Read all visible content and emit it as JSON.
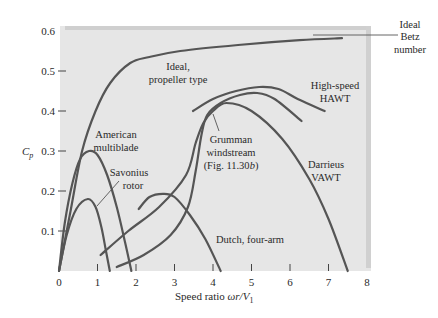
{
  "chart_data": {
    "type": "line",
    "title": "",
    "xlabel": "Speed ratio ωr/V₁",
    "ylabel": "Cp",
    "xlim": [
      0,
      8
    ],
    "ylim": [
      0,
      0.6
    ],
    "x_ticks": [
      0,
      1,
      2,
      3,
      4,
      5,
      6,
      7,
      8
    ],
    "y_ticks": [
      0.1,
      0.2,
      0.3,
      0.4,
      0.5,
      0.6
    ],
    "x_tick_labels": [
      "0",
      "1",
      "2",
      "3",
      "4",
      "5",
      "6",
      "7",
      "8"
    ],
    "y_tick_labels": [
      "0.1",
      "0.2",
      "0.3",
      "0.4",
      "0.5",
      "0.6"
    ],
    "grid": false,
    "legend": "none (inline annotations)",
    "series": [
      {
        "name": "Ideal, propeller type",
        "x": [
          0,
          0.3,
          0.6,
          0.95,
          1.33,
          1.85,
          2.35,
          3.15,
          4.65,
          6.25,
          7.35
        ],
        "y": [
          0,
          0.15,
          0.3,
          0.4,
          0.47,
          0.52,
          0.535,
          0.55,
          0.565,
          0.577,
          0.582
        ]
      },
      {
        "name": "Ideal Betz number",
        "x": [
          6.4,
          7.3
        ],
        "y": [
          0.593,
          0.593
        ]
      },
      {
        "name": "American multiblade",
        "x": [
          0,
          0.15,
          0.35,
          0.55,
          0.78,
          1.0,
          1.25,
          1.5,
          1.72,
          1.88
        ],
        "y": [
          0,
          0.12,
          0.22,
          0.28,
          0.3,
          0.29,
          0.24,
          0.16,
          0.07,
          0
        ]
      },
      {
        "name": "Savonius rotor",
        "x": [
          0,
          0.2,
          0.45,
          0.75,
          0.95,
          1.1,
          1.22,
          1.32
        ],
        "y": [
          0,
          0.09,
          0.155,
          0.18,
          0.16,
          0.11,
          0.05,
          0
        ]
      },
      {
        "name": "Dutch, four-arm",
        "x": [
          2.07,
          2.35,
          2.7,
          3.0,
          3.4,
          3.8,
          4.2
        ],
        "y": [
          0.155,
          0.185,
          0.193,
          0.185,
          0.14,
          0.08,
          0.0
        ]
      },
      {
        "name": "Grumman windstream (Fig. 11.30b)",
        "x": [
          1.5,
          2.2,
          2.9,
          3.35,
          3.55,
          3.7,
          3.85,
          4.2,
          4.7,
          5.15,
          5.6,
          6.3
        ],
        "y": [
          0.01,
          0.04,
          0.09,
          0.16,
          0.25,
          0.34,
          0.39,
          0.42,
          0.44,
          0.445,
          0.43,
          0.375
        ]
      },
      {
        "name": "Darrieus VAWT",
        "x": [
          1.08,
          1.8,
          2.6,
          3.3,
          3.55,
          3.75,
          4.0,
          4.35,
          5.0,
          5.8,
          6.5,
          7.0,
          7.5
        ],
        "y": [
          0.04,
          0.1,
          0.16,
          0.24,
          0.32,
          0.37,
          0.4,
          0.42,
          0.4,
          0.33,
          0.23,
          0.13,
          0.0
        ]
      },
      {
        "name": "High-speed HAWT",
        "x": [
          3.48,
          4.0,
          4.6,
          5.2,
          5.7,
          6.2,
          6.9
        ],
        "y": [
          0.4,
          0.43,
          0.45,
          0.46,
          0.455,
          0.43,
          0.4
        ]
      }
    ],
    "annotations": [
      {
        "text": [
          "Ideal,",
          "propeller type"
        ],
        "x": 3.1,
        "y": 0.51
      },
      {
        "text": [
          "Ideal",
          "Betz",
          "number"
        ],
        "x": 8.55,
        "y": 0.615
      },
      {
        "text": [
          "High-speed",
          "HAWT"
        ],
        "x": 6.7,
        "y": 0.425
      },
      {
        "text": [
          "American",
          "multiblade"
        ],
        "x": 1.5,
        "y": 0.335
      },
      {
        "text": [
          "Savonius",
          "rotor"
        ],
        "x": 1.4,
        "y": 0.255
      },
      {
        "text": [
          "Grumman",
          "windstream",
          "(Fig. 11.30b)"
        ],
        "x": 4.45,
        "y": 0.315
      },
      {
        "text": [
          "Darrieus",
          "VAWT"
        ],
        "x": 6.5,
        "y": 0.245
      },
      {
        "text": [
          "Dutch, four-arm"
        ],
        "x": 5.15,
        "y": 0.085
      }
    ],
    "colors": {
      "plot_bg": "#e6e6e6",
      "plot_edge": "#cfcfcf",
      "curve": "#555555",
      "text": "#2a2a2a"
    }
  },
  "labels": {
    "ylabel_main": "C",
    "ylabel_sub": "p",
    "xlabel_main": "Speed ratio ",
    "xlabel_italic": "ωr/V",
    "xlabel_sub": "1",
    "annot_ideal_1": "Ideal,",
    "annot_ideal_2": "propeller type",
    "annot_betz_1": "Ideal",
    "annot_betz_2": "Betz",
    "annot_betz_3": "number",
    "annot_hawt_1": "High-speed",
    "annot_hawt_2": "HAWT",
    "annot_american_1": "American",
    "annot_american_2": "multiblade",
    "annot_savonius_1": "Savonius",
    "annot_savonius_2": "rotor",
    "annot_grumman_1": "Grumman",
    "annot_grumman_2": "windstream",
    "annot_grumman_3a": "(Fig. 11.30",
    "annot_grumman_3b": "b",
    "annot_grumman_3c": ")",
    "annot_darrieus_1": "Darrieus",
    "annot_darrieus_2": "VAWT",
    "annot_dutch": "Dutch, four-arm"
  }
}
